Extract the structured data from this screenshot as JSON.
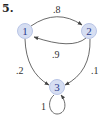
{
  "problem": {
    "number": "5."
  },
  "colors": {
    "node_fill": "#d6def2",
    "node_stroke": "#b9c5e6",
    "node_text": "#2a3a8c",
    "edge": "#444444"
  },
  "nodes": [
    {
      "id": "1",
      "label": "1"
    },
    {
      "id": "2",
      "label": "2"
    },
    {
      "id": "3",
      "label": "3"
    }
  ],
  "edges": [
    {
      "from": "1",
      "to": "2",
      "label": ".8"
    },
    {
      "from": "2",
      "to": "1",
      "label": ".9"
    },
    {
      "from": "1",
      "to": "3",
      "label": ".2"
    },
    {
      "from": "2",
      "to": "3",
      "label": ".1"
    },
    {
      "from": "3",
      "to": "3",
      "label": "1"
    }
  ]
}
